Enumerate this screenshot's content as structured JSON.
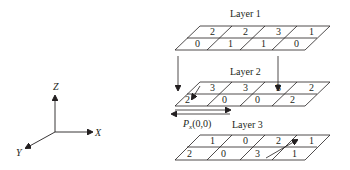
{
  "layers": [
    {
      "label": "Layer 1",
      "back_row": [
        "2",
        "2",
        "3",
        "1"
      ],
      "front_row": [
        "0",
        "1",
        "1",
        "0"
      ]
    },
    {
      "label": "Layer 2",
      "back_row": [
        "3",
        "3",
        "3",
        "2"
      ],
      "front_row": [
        "2",
        "0",
        "0",
        "2"
      ]
    },
    {
      "label": "Layer 3",
      "back_row": [
        "1",
        "0",
        "2",
        "1"
      ],
      "front_row": [
        "2",
        "0",
        "3",
        "1"
      ]
    }
  ],
  "annotation": {
    "pointer_label": "P",
    "pointer_sub": "x",
    "pointer_args": "(0,0)"
  },
  "axes": {
    "z": "Z",
    "x": "X",
    "y": "Y"
  }
}
